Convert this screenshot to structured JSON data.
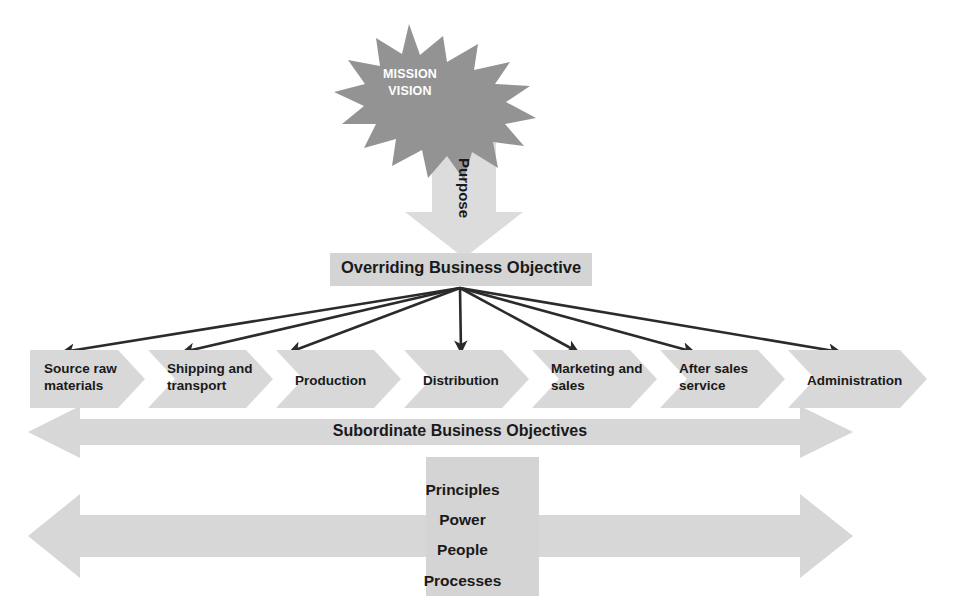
{
  "diagram": {
    "colors": {
      "burst_fill": "#939393",
      "burst_text": "#ffffff",
      "band_fill": "#d7d7d7",
      "band_fill_light": "#dcdcdc",
      "box_fill": "#d4d4d4",
      "arrow_stroke": "#2b2b2b",
      "text": "#1a1a1a",
      "background": "#ffffff"
    },
    "starburst": {
      "name": "mission-vision-starburst",
      "lines": "MISSION\nVISION",
      "line_1": "MISSION",
      "line_2": "VISION"
    },
    "purpose_arrow": {
      "name": "purpose-down-arrow",
      "label": "Purpose",
      "direction": "down"
    },
    "overriding_objective": {
      "name": "overriding-business-objective",
      "label": "Overriding Business Objective"
    },
    "fan_arrows": {
      "count": 7,
      "origin_x": 460,
      "origin_y": 288,
      "targets_x": [
        63,
        183,
        290,
        405,
        520,
        636,
        752
      ]
    },
    "value_chain": {
      "name": "value-chain-chevrons",
      "steps": [
        {
          "id": "source-raw-materials",
          "label": "Source raw\nmaterials"
        },
        {
          "id": "shipping-and-transport",
          "label": "Shipping and\ntransport"
        },
        {
          "id": "production",
          "label": "Production"
        },
        {
          "id": "distribution",
          "label": "Distribution"
        },
        {
          "id": "marketing-and-sales",
          "label": "Marketing and\nsales"
        },
        {
          "id": "after-sales-service",
          "label": "After sales\nservice"
        },
        {
          "id": "administration",
          "label": "Administration"
        }
      ]
    },
    "subordinate_band": {
      "name": "subordinate-business-objectives-arrow",
      "label": "Subordinate Business Objectives",
      "direction": "double"
    },
    "enablers_band": {
      "name": "enablers-double-arrow",
      "label": "",
      "direction": "double"
    },
    "enablers": {
      "name": "enablers-block",
      "lines": "Principles\nPower\nPeople\nProcesses",
      "items": [
        "Principles",
        "Power",
        "People",
        "Processes"
      ]
    }
  }
}
